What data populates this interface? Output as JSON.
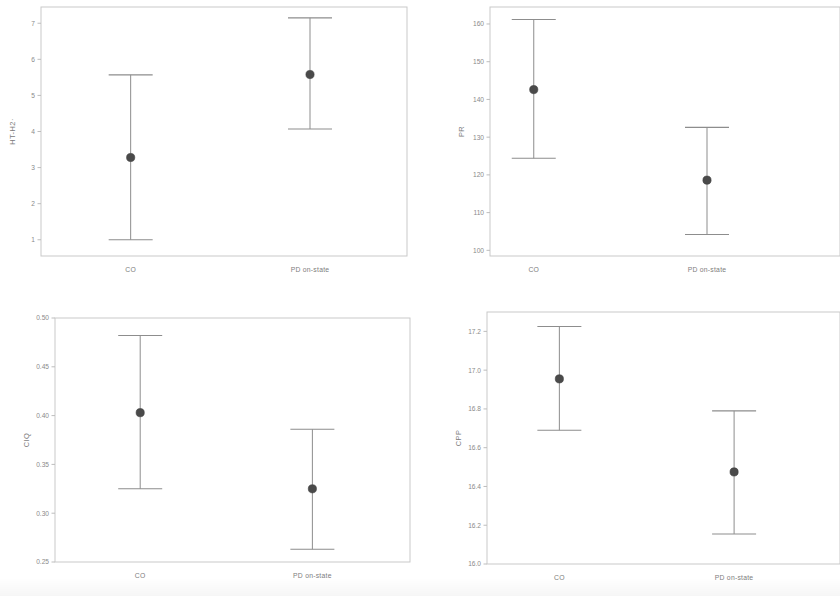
{
  "figure": {
    "kind": "error-bar-panel-grid",
    "rows": 2,
    "columns": 2,
    "marker_color": "#4a4a4a",
    "line_color": "#8d8d8d",
    "frame_color": "#c9c9c9",
    "background_color": "#ffffff"
  },
  "chart_data": [
    {
      "type": "scatter",
      "panel": "top-left",
      "title": "",
      "xlabel": "",
      "ylabel": "HT-H2·",
      "categories": [
        "CO",
        "PD on-state"
      ],
      "values": [
        3.28,
        5.58
      ],
      "error_low": [
        1.0,
        4.07
      ],
      "error_high": [
        5.57,
        7.15
      ],
      "ylim": [
        0.55,
        7.45
      ],
      "yticks": [
        1,
        2,
        3,
        4,
        5,
        6,
        7
      ],
      "ytick_labels": [
        "1",
        "2",
        "3",
        "4",
        "5",
        "6",
        "7"
      ],
      "grid": false,
      "legend": "none"
    },
    {
      "type": "scatter",
      "panel": "top-right",
      "title": "",
      "xlabel": "",
      "ylabel": "PR",
      "categories": [
        "CO",
        "PD on-state"
      ],
      "values": [
        142.6,
        118.6
      ],
      "error_low": [
        124.4,
        104.2
      ],
      "error_high": [
        161.2,
        132.6
      ],
      "ylim": [
        98.5,
        164.5
      ],
      "yticks": [
        100,
        110,
        120,
        130,
        140,
        150,
        160
      ],
      "ytick_labels": [
        "100",
        "110",
        "120",
        "130",
        "140",
        "150",
        "160"
      ],
      "grid": false,
      "legend": "none"
    },
    {
      "type": "scatter",
      "panel": "bottom-left",
      "title": "",
      "xlabel": "",
      "ylabel": "CIQ",
      "categories": [
        "CO",
        "PD on-state"
      ],
      "values": [
        0.403,
        0.325
      ],
      "error_low": [
        0.325,
        0.263
      ],
      "error_high": [
        0.482,
        0.386
      ],
      "ylim": [
        0.25,
        0.5
      ],
      "yticks": [
        0.25,
        0.3,
        0.35,
        0.4,
        0.45,
        0.5
      ],
      "ytick_labels": [
        "0.25",
        "0.30",
        "0.35",
        "0.40",
        "0.45",
        "0.50"
      ],
      "grid": false,
      "legend": "none"
    },
    {
      "type": "scatter",
      "panel": "bottom-right",
      "title": "",
      "xlabel": "",
      "ylabel": "CPP",
      "categories": [
        "CO",
        "PD on-state"
      ],
      "values": [
        16.955,
        16.475
      ],
      "error_low": [
        16.69,
        16.155
      ],
      "error_high": [
        17.225,
        16.79
      ],
      "ylim": [
        16.0,
        17.3
      ],
      "yticks": [
        16.0,
        16.2,
        16.4,
        16.6,
        16.8,
        17.0,
        17.2
      ],
      "ytick_labels": [
        "16.0",
        "16.2",
        "16.4",
        "16.6",
        "16.8",
        "17.0",
        "17.2"
      ],
      "grid": false,
      "legend": "none"
    }
  ]
}
